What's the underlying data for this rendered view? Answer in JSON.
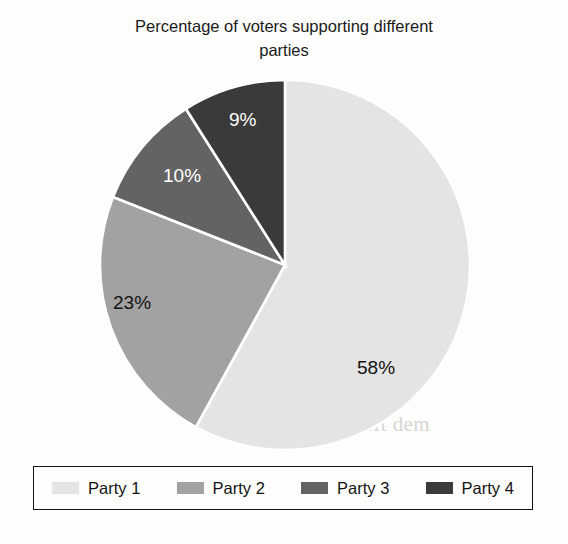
{
  "chart_data": {
    "type": "pie",
    "title": "Percentage of voters supporting different parties",
    "title_line1": "Percentage of voters supporting different",
    "title_line2": "parties",
    "categories": [
      "Party 1",
      "Party 2",
      "Party 3",
      "Party 4"
    ],
    "values": [
      58,
      23,
      10,
      9
    ],
    "value_labels": [
      "58%",
      "23%",
      "10%",
      "9%"
    ],
    "unit": "%",
    "colors": [
      "#e4e4e4",
      "#a2a2a2",
      "#636363",
      "#3a3a3a"
    ],
    "label_text_colors": [
      "#131313",
      "#131313",
      "#ffffff",
      "#ffffff"
    ],
    "start_angle_deg": 0,
    "direction": "clockwise",
    "separator_color": "#ffffff",
    "legend_position": "bottom",
    "legend_border_color": "#111111",
    "grid": false,
    "background": "#fdfdfc"
  },
  "title": {
    "line1": "Percentage of voters supporting different",
    "line2": "parties"
  },
  "slices": [
    {
      "label": "58%",
      "name": "Party 1",
      "value": 58,
      "color": "#e4e4e4"
    },
    {
      "label": "23%",
      "name": "Party 2",
      "value": 23,
      "color": "#a2a2a2"
    },
    {
      "label": "10%",
      "name": "Party 3",
      "value": 10,
      "color": "#636363"
    },
    {
      "label": "9%",
      "name": "Party 4",
      "value": 9,
      "color": "#3a3a3a"
    }
  ],
  "legend": {
    "items": [
      {
        "label": "Party 1",
        "color": "#e4e4e4"
      },
      {
        "label": "Party 2",
        "color": "#a2a2a2"
      },
      {
        "label": "Party 3",
        "color": "#636363"
      },
      {
        "label": "Party 4",
        "color": "#3a3a3a"
      }
    ]
  },
  "bleed_text": "ventuali\ne tenden\ning elect\nn vot. Inde\norted an ov\nigh per\nthat the line\ne turned as v\nrget. Germa\n. The Left dem"
}
